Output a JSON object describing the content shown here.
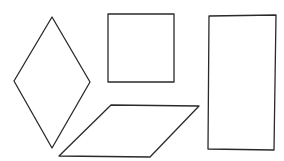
{
  "canvas": {
    "width": 284,
    "height": 161,
    "background": "#ffffff",
    "stroke": "#2a2a2a"
  },
  "shapes": [
    {
      "id": "rhombus",
      "label": "rhombus",
      "points": "52,17 90,82 52,148 14,81"
    },
    {
      "id": "square",
      "label": "square",
      "points": "108,14 174,14 174,82 108,82"
    },
    {
      "id": "parallelogram",
      "label": "parallelogram",
      "points": "111,105 199,106 150,157 59,156"
    },
    {
      "id": "rectangle",
      "label": "rectangle",
      "points": "209,16 276,15 274,150 208,149"
    }
  ]
}
